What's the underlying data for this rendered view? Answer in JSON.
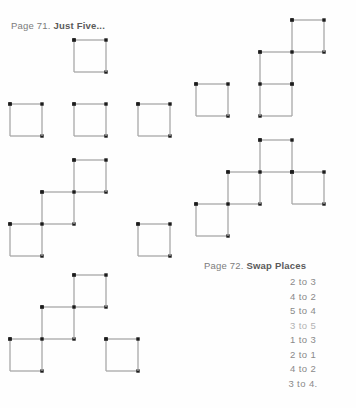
{
  "page": {
    "background_color": "#fefefe",
    "stick_color": "#a8a8a8",
    "match_head_color": "#1c1c1c",
    "text_color": "#767676"
  },
  "headings": {
    "page71": {
      "lead": "Page 71.",
      "title": "Just Five..."
    },
    "page72": {
      "lead": "Page 72.",
      "title": "Swap Places"
    }
  },
  "swap_places_list": [
    {
      "text": "2 to 3",
      "faded": false
    },
    {
      "text": "4 to 2",
      "faded": false
    },
    {
      "text": "5 to 4",
      "faded": false
    },
    {
      "text": "3 to 5",
      "faded": true
    },
    {
      "text": "1 to 3",
      "faded": false
    },
    {
      "text": "2 to 1",
      "faded": false
    },
    {
      "text": "4 to 2",
      "faded": false
    },
    {
      "text": "3 to 4.",
      "faded": false
    }
  ],
  "figures": [
    {
      "name": "figure-top-left-plus",
      "x": 10,
      "y": 40,
      "width": 180,
      "height": 105,
      "cell": 32,
      "squares": [
        [
          2,
          0
        ],
        [
          0,
          2
        ],
        [
          2,
          2
        ],
        [
          4,
          2
        ]
      ]
    },
    {
      "name": "figure-top-right-staircase",
      "x": 196,
      "y": 20,
      "width": 160,
      "height": 125,
      "cell": 32,
      "squares": [
        [
          3,
          0
        ],
        [
          2,
          1
        ],
        [
          0,
          2
        ],
        [
          2,
          2
        ]
      ]
    },
    {
      "name": "figure-middle-left-diagonal",
      "x": 10,
      "y": 160,
      "width": 180,
      "height": 110,
      "cell": 32,
      "squares": [
        [
          2,
          0
        ],
        [
          1,
          1
        ],
        [
          0,
          2
        ],
        [
          4,
          2
        ]
      ]
    },
    {
      "name": "figure-middle-right-branch",
      "x": 196,
      "y": 140,
      "width": 160,
      "height": 120,
      "cell": 32,
      "squares": [
        [
          2,
          0
        ],
        [
          1,
          1
        ],
        [
          3,
          1
        ],
        [
          0,
          2
        ]
      ]
    },
    {
      "name": "figure-bottom-left-diagonal",
      "x": 10,
      "y": 275,
      "width": 180,
      "height": 120,
      "cell": 32,
      "squares": [
        [
          2,
          0
        ],
        [
          1,
          1
        ],
        [
          0,
          2
        ],
        [
          3,
          2
        ]
      ]
    }
  ]
}
